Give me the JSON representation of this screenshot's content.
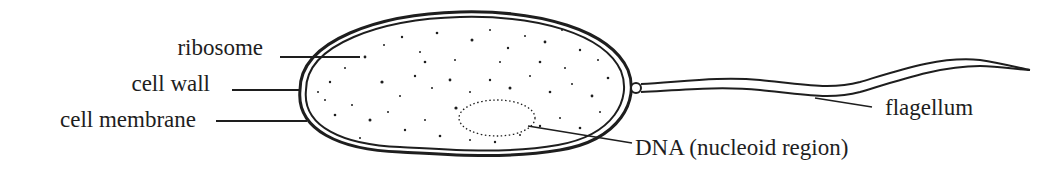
{
  "diagram": {
    "labels": {
      "ribosome": "ribosome",
      "cell_wall": "cell wall",
      "cell_membrane": "cell membrane",
      "dna": "DNA (nucleoid region)",
      "flagellum": "flagellum"
    },
    "colors": {
      "ink": "#1e1e1e",
      "background": "#ffffff"
    }
  }
}
